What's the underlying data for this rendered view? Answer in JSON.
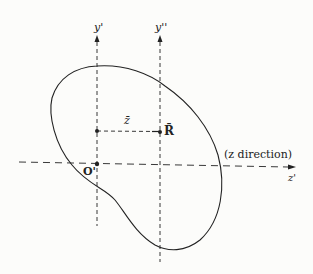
{
  "diagram": {
    "axes": {
      "y_prime": "y'",
      "y_double_prime": "y''",
      "z_prime": "z'"
    },
    "labels": {
      "z_bar": "z̄",
      "R_bar": "R̄",
      "origin": "O'",
      "direction": "(z direction)"
    },
    "colors": {
      "stroke": "#222222",
      "background": "#fcfcfa"
    }
  }
}
